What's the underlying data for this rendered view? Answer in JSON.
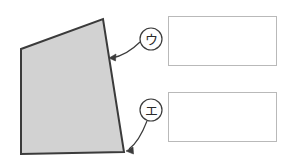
{
  "canvas": {
    "width": 293,
    "height": 167,
    "background_color": "#ffffff"
  },
  "figure": {
    "name": "quadrilateral",
    "fill_color": "#d2d2d2",
    "stroke_color": "#3b3b3b",
    "stroke_width": 2,
    "vertices": [
      {
        "x": 21,
        "y": 49
      },
      {
        "x": 103,
        "y": 19
      },
      {
        "x": 124,
        "y": 152
      },
      {
        "x": 21,
        "y": 154
      }
    ]
  },
  "markers": [
    {
      "id": "marker-u",
      "label": "ウ",
      "circle": {
        "cx": 151,
        "cy": 39,
        "r": 11
      },
      "stroke_color": "#3b3b3b",
      "leader": {
        "path": "M 140 42 C 132 50 122 56 112 58",
        "arrow_at": {
          "x": 109,
          "y": 58
        }
      }
    },
    {
      "id": "marker-e",
      "label": "エ",
      "circle": {
        "cx": 151,
        "cy": 110,
        "r": 11
      },
      "stroke_color": "#3b3b3b",
      "leader": {
        "path": "M 147 121 C 142 134 136 144 129 149",
        "arrow_at": {
          "x": 126,
          "y": 151
        }
      }
    }
  ],
  "answer_boxes": [
    {
      "id": "answer-box-1",
      "value": "",
      "placeholder": "",
      "border_color": "#b9b9b9",
      "x": 168,
      "y": 16,
      "width": 109,
      "height": 50
    },
    {
      "id": "answer-box-2",
      "value": "",
      "placeholder": "",
      "border_color": "#b9b9b9",
      "x": 168,
      "y": 92,
      "width": 109,
      "height": 50
    }
  ]
}
